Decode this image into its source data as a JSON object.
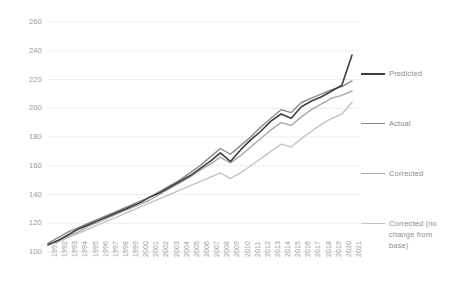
{
  "chart_data": {
    "type": "line",
    "title": "",
    "xlabel": "",
    "ylabel": "",
    "ylim": [
      100,
      260
    ],
    "ytick_step": 20,
    "grid": true,
    "grid_axis": "y",
    "legend_position": "right",
    "yticks": [
      "260",
      "240",
      "220",
      "200",
      "180",
      "160",
      "140",
      "120",
      "100"
    ],
    "categories": [
      "1991",
      "1992",
      "1993",
      "1994",
      "1995",
      "1996",
      "1997",
      "1998",
      "1999",
      "2000",
      "2001",
      "2002",
      "2003",
      "2004",
      "2005",
      "2006",
      "2007",
      "2008",
      "2009",
      "2010",
      "2011",
      "2012",
      "2013",
      "2014",
      "2015",
      "2016",
      "2017",
      "2018",
      "2019",
      "2020",
      "2021"
    ],
    "series": [
      {
        "name": "Predicted",
        "color": "#3f3f3f",
        "width": 1.6,
        "values": [
          105,
          108,
          112,
          116,
          119,
          122,
          125,
          128,
          131,
          134,
          138,
          141,
          145,
          149,
          153,
          158,
          163,
          169,
          163,
          171,
          178,
          184,
          191,
          196,
          193,
          201,
          205,
          208,
          212,
          216,
          237
        ]
      },
      {
        "name": "Actual",
        "color": "#8a8a8a",
        "width": 1.4,
        "values": [
          106,
          110,
          114,
          117,
          120,
          123,
          126,
          129,
          132,
          135,
          138,
          142,
          146,
          150,
          155,
          160,
          166,
          172,
          168,
          174,
          180,
          187,
          193,
          199,
          197,
          204,
          207,
          210,
          213,
          215,
          219
        ]
      },
      {
        "name": "Corrected",
        "color": "#a8a8a8",
        "width": 1.4,
        "values": [
          105,
          108,
          111,
          114,
          118,
          121,
          124,
          127,
          130,
          133,
          136,
          140,
          144,
          148,
          152,
          157,
          161,
          166,
          162,
          167,
          173,
          179,
          185,
          190,
          188,
          194,
          199,
          203,
          207,
          209,
          212
        ]
      },
      {
        "name": "Corrected (no change from base)",
        "color": "#c4c4c4",
        "width": 1.4,
        "values": [
          105,
          107,
          110,
          113,
          116,
          119,
          122,
          125,
          128,
          131,
          134,
          137,
          140,
          143,
          146,
          149,
          152,
          155,
          151,
          155,
          160,
          165,
          170,
          175,
          173,
          179,
          184,
          189,
          193,
          196,
          204
        ]
      }
    ]
  },
  "legend": {
    "entries": [
      {
        "label": "Predicted",
        "color": "#3f3f3f",
        "top": 68
      },
      {
        "label": "Actual",
        "color": "#8a8a8a",
        "top": 118
      },
      {
        "label": "Corrected",
        "color": "#a8a8a8",
        "top": 168
      },
      {
        "label": "Corrected (no change from base)",
        "color": "#c4c4c4",
        "top": 218
      }
    ]
  },
  "axes": {
    "grid_color": "#e8e8e8",
    "tick_color": "#9a9a9a"
  }
}
